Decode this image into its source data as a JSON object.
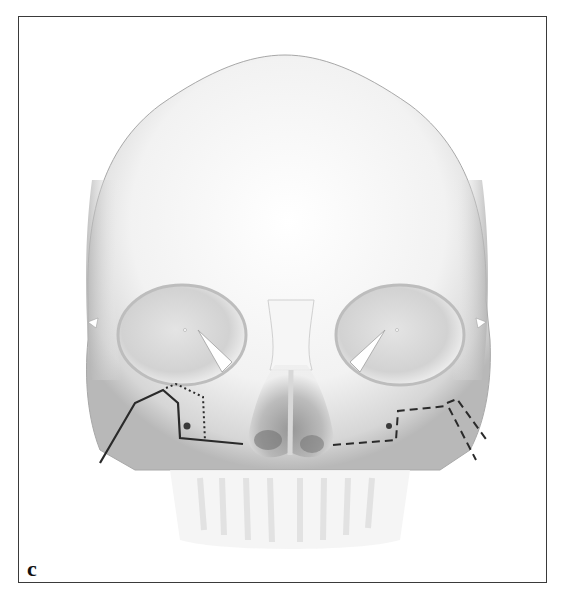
{
  "figure": {
    "panel_label": "c",
    "colors": {
      "frame": "#3a3a3a",
      "lines": "#2a2a2a",
      "background": "#ffffff",
      "bone_shade": "#c8c8c8"
    },
    "annotations": [
      {
        "name": "solid-osteotomy-line",
        "style": "solid",
        "side": "right-of-patient (image left)"
      },
      {
        "name": "dotted-osteotomy-line",
        "style": "dotted",
        "side": "right-of-patient (image left)"
      },
      {
        "name": "dashed-osteotomy-line",
        "style": "dashed",
        "side": "left-of-patient (image right)"
      }
    ]
  }
}
